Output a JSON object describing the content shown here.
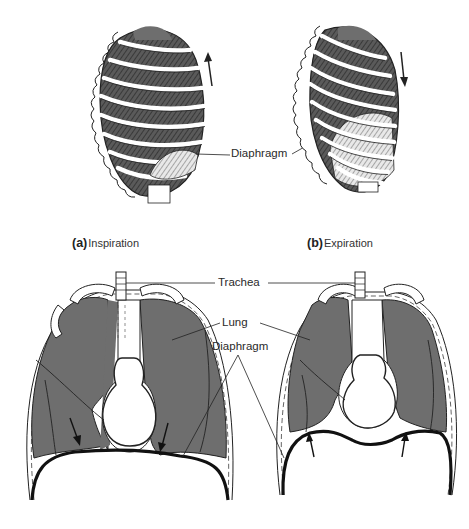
{
  "figure": {
    "top_panels": [
      {
        "id": "a",
        "letter": "(a)",
        "caption": "Inspiration",
        "arrow": "up"
      },
      {
        "id": "b",
        "letter": "(b)",
        "caption": "Expiration",
        "arrow": "down"
      }
    ],
    "labels": {
      "diaphragm_top": "Diaphragm",
      "trachea": "Trachea",
      "lung": "Lung",
      "diaphragm_bottom": "Diaphragm"
    },
    "colors": {
      "lung_fill": "#6e6e6e",
      "bone": "#ffffff",
      "outline": "#1e1e1e",
      "background": "#ffffff"
    }
  }
}
